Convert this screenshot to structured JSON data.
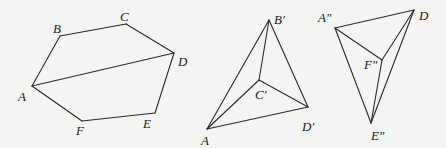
{
  "figures": [
    {
      "name": "hexagon",
      "vertices": {
        "A": {
          "x": 32,
          "y": 86,
          "label": "A",
          "lx": 18,
          "ly": 101
        },
        "B": {
          "x": 60,
          "y": 36,
          "label": "B",
          "lx": 53,
          "ly": 33
        },
        "C": {
          "x": 126,
          "y": 24,
          "label": "C",
          "lx": 120,
          "ly": 21
        },
        "D": {
          "x": 174,
          "y": 53,
          "label": "D",
          "lx": 178,
          "ly": 66
        },
        "E": {
          "x": 155,
          "y": 113,
          "label": "E",
          "lx": 143,
          "ly": 128
        },
        "F": {
          "x": 82,
          "y": 121,
          "label": "F",
          "lx": 76,
          "ly": 135
        }
      },
      "edges": [
        [
          "A",
          "B"
        ],
        [
          "B",
          "C"
        ],
        [
          "C",
          "D"
        ],
        [
          "D",
          "E"
        ],
        [
          "E",
          "F"
        ],
        [
          "F",
          "A"
        ],
        [
          "A",
          "D"
        ]
      ]
    },
    {
      "name": "tetrahedron-1",
      "vertices": {
        "A": {
          "x": 207,
          "y": 129,
          "label": "A",
          "lx": 201,
          "ly": 145
        },
        "B'": {
          "x": 269,
          "y": 20,
          "label": "B′",
          "lx": 274,
          "ly": 24
        },
        "C'": {
          "x": 259,
          "y": 80,
          "label": "C′",
          "lx": 255,
          "ly": 99
        },
        "D'": {
          "x": 308,
          "y": 107,
          "label": "D′",
          "lx": 302,
          "ly": 131
        }
      },
      "edges": [
        [
          "A",
          "B'"
        ],
        [
          "B'",
          "C'"
        ],
        [
          "C'",
          "A"
        ],
        [
          "C'",
          "D'"
        ],
        [
          "B'",
          "D'"
        ],
        [
          "A",
          "D'"
        ]
      ]
    },
    {
      "name": "tetrahedron-2",
      "vertices": {
        "A''": {
          "x": 335,
          "y": 28,
          "label": "A″",
          "lx": 318,
          "ly": 22
        },
        "D": {
          "x": 414,
          "y": 10,
          "label": "D",
          "lx": 419,
          "ly": 20
        },
        "F''": {
          "x": 382,
          "y": 60,
          "label": "F″",
          "lx": 364,
          "ly": 69
        },
        "E''": {
          "x": 371,
          "y": 123,
          "label": "E″",
          "lx": 371,
          "ly": 140
        }
      },
      "edges": [
        [
          "A''",
          "D"
        ],
        [
          "A''",
          "F''"
        ],
        [
          "A''",
          "E''"
        ],
        [
          "F''",
          "D"
        ],
        [
          "F''",
          "E''"
        ],
        [
          "D",
          "E''"
        ]
      ]
    }
  ]
}
